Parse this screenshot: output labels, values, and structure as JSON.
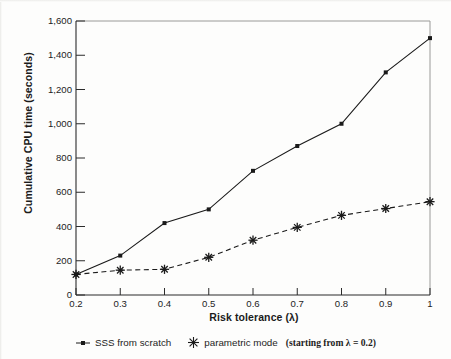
{
  "chart_data": {
    "type": "line",
    "title": "",
    "xlabel": "Risk tolerance (λ)",
    "ylabel": "Cumulative CPU time (seconds)",
    "x": [
      0.2,
      0.3,
      0.4,
      0.5,
      0.6,
      0.7,
      0.8,
      0.9,
      1.0
    ],
    "xtick_labels": [
      "0.2",
      "0.3",
      "0.4",
      "0.5",
      "0.6",
      "0.7",
      "0.8",
      "0.9",
      "1"
    ],
    "ytick_labels": [
      "0",
      "200",
      "400",
      "600",
      "800",
      "1,000",
      "1,200",
      "1,400",
      "1,600"
    ],
    "ytick_values": [
      0,
      200,
      400,
      600,
      800,
      1000,
      1200,
      1400,
      1600
    ],
    "xlim": [
      0.2,
      1.0
    ],
    "ylim": [
      0,
      1600
    ],
    "grid": false,
    "legend_position": "below",
    "series": [
      {
        "name": "SSS from scratch",
        "marker": "square",
        "line_style": "solid",
        "color": "#1a1a1a",
        "values": [
          120,
          230,
          420,
          500,
          725,
          870,
          1000,
          1300,
          1500
        ]
      },
      {
        "name": "parametric mode",
        "note": "(starting from λ = 0.2)",
        "marker": "asterisk",
        "line_style": "dashed",
        "color": "#1a1a1a",
        "values": [
          120,
          145,
          150,
          220,
          320,
          395,
          465,
          505,
          545
        ]
      }
    ]
  },
  "legend": {
    "entries": [
      {
        "label": "SSS from scratch",
        "note": ""
      },
      {
        "label": "parametric mode",
        "note": "(starting from λ = 0.2)"
      }
    ]
  },
  "axes": {
    "x_title": "Risk tolerance (λ)",
    "y_title": "Cumulative CPU time (seconds)"
  }
}
